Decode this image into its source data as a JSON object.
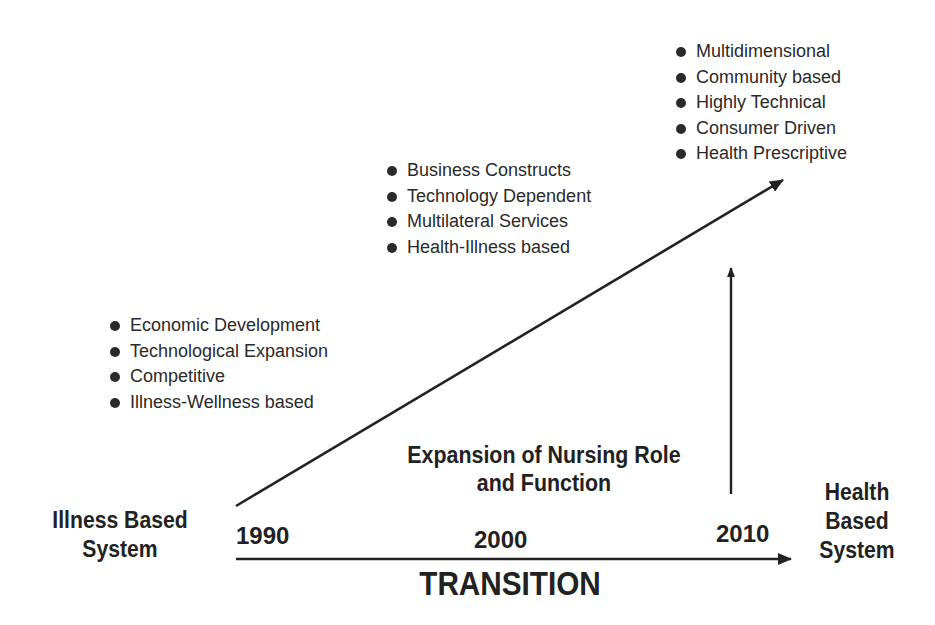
{
  "diagram": {
    "start_label": "Illness Based System",
    "start_lines": [
      "Illness Based",
      "System"
    ],
    "end_label": "Health Based System",
    "end_lines": [
      "Health",
      "Based",
      "System"
    ],
    "axis_label": "TRANSITION",
    "center_label_lines": [
      "Expansion of Nursing Role",
      "and Function"
    ],
    "years": [
      "1990",
      "2000",
      "2010"
    ],
    "stages": [
      {
        "year": "1990",
        "items": [
          "Economic Development",
          "Technological Expansion",
          "Competitive",
          "Illness-Wellness based"
        ]
      },
      {
        "year": "2000",
        "items": [
          "Business Constructs",
          "Technology Dependent",
          "Multilateral Services",
          "Health-Illness based"
        ]
      },
      {
        "year": "2010",
        "items": [
          "Multidimensional",
          "Community based",
          "Highly Technical",
          "Consumer Driven",
          "Health Prescriptive"
        ]
      }
    ],
    "colors": {
      "ink": "#222222",
      "background": "#ffffff"
    }
  }
}
